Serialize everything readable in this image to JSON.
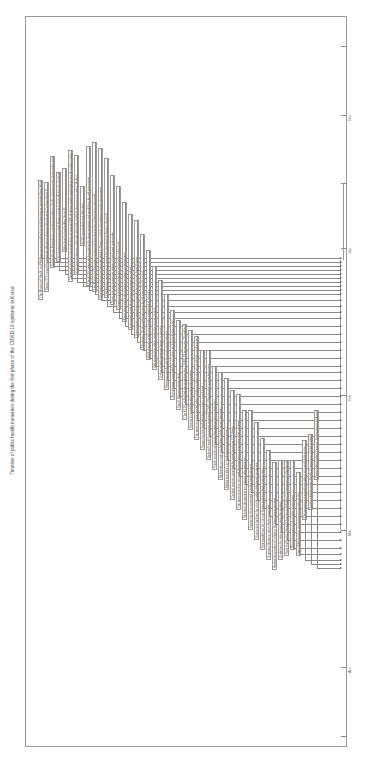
{
  "figure": {
    "title": "Timeline of public health measures during the first phase of the COVID-19 epidemic in Korea",
    "axis_color": "#9a9a9a",
    "text_color": "#444444"
  },
  "axis": {
    "ticks": [
      {
        "y": 46,
        "label": ""
      },
      {
        "y": 115,
        "label": "Dec"
      },
      {
        "y": 183,
        "label": ""
      },
      {
        "y": 248,
        "label": "Jan"
      },
      {
        "y": 395,
        "label": "Feb"
      },
      {
        "y": 530,
        "label": "Mar"
      },
      {
        "y": 667,
        "label": "Apr"
      },
      {
        "y": 736,
        "label": ""
      }
    ]
  },
  "events": [
    {
      "x": 38,
      "y": 300,
      "len": 120,
      "arrow_y": 258,
      "text": "The Ministry of Health and Welfare announced the first confirmed case (imported from Wuhan)"
    },
    {
      "x": 44,
      "y": 292,
      "len": 110,
      "arrow_y": 262,
      "text": "Korea CDC raised the national infectious disease alert level to Caution (level 2)"
    },
    {
      "x": 50,
      "y": 268,
      "len": 112,
      "arrow_y": 266,
      "text": "Special Entry Procedures including mandatory health questionnaires for travelers from Hubei"
    },
    {
      "x": 56,
      "y": 262,
      "len": 90,
      "arrow_y": 270,
      "text": "The government evacuated Korean citizens from Wuhan by chartered flights"
    },
    {
      "x": 62,
      "y": 252,
      "len": 84,
      "arrow_y": 274,
      "text": "Alert level raised to Alert (level 3)"
    },
    {
      "x": 68,
      "y": 282,
      "len": 132,
      "arrow_y": 278,
      "text": "The government announced plans to secure 50% of domestically produced masks for public supply"
    },
    {
      "x": 74,
      "y": 275,
      "len": 120,
      "arrow_y": 282,
      "text": "Entry ban on foreign nationals who had visited Hubei province within 14 days"
    },
    {
      "x": 80,
      "y": 246,
      "len": 60,
      "arrow_y": 286,
      "text": "KCDC expanded case definition"
    },
    {
      "x": 86,
      "y": 286,
      "len": 140,
      "arrow_y": 290,
      "text": "The KCDC released the criteria for close contacts and guidelines for self-quarantine"
    },
    {
      "x": 92,
      "y": 292,
      "len": 150,
      "arrow_y": 294,
      "text": "The Ministry of Education postponed the start of the school year nationwide"
    },
    {
      "x": 98,
      "y": 300,
      "len": 152,
      "arrow_y": 300,
      "text": "Shincheonji church cluster identified in Daegu; special management zones designated"
    },
    {
      "x": 104,
      "y": 298,
      "len": 140,
      "arrow_y": 306,
      "text": "The Korean government raised the alert level to Serious (level 4)"
    },
    {
      "x": 110,
      "y": 305,
      "len": 130,
      "arrow_y": 312,
      "text": "Drive-through screening stations introduced nationwide"
    },
    {
      "x": 116,
      "y": 310,
      "len": 124,
      "arrow_y": 318,
      "text": "Community treatment centers opened for mild cases"
    },
    {
      "x": 122,
      "y": 322,
      "len": 120,
      "arrow_y": 326,
      "text": "Mask rationing (5-day rotation system) implemented"
    },
    {
      "x": 128,
      "y": 330,
      "len": 116,
      "arrow_y": 334,
      "text": "Enhanced social distancing campaign launched"
    },
    {
      "x": 134,
      "y": 338,
      "len": 118,
      "arrow_y": 342,
      "text": "Special entry procedures expanded to all arrivals from Europe"
    },
    {
      "x": 140,
      "y": 350,
      "len": 116,
      "arrow_y": 350,
      "text": "Mandatory 14-day self-quarantine for all international arrivals"
    },
    {
      "x": 146,
      "y": 360,
      "len": 110,
      "arrow_y": 358,
      "text": "Walk-through screening booths introduced at airports"
    },
    {
      "x": 152,
      "y": 370,
      "len": 104,
      "arrow_y": 366,
      "text": "Self-quarantine safety protection app launched"
    },
    {
      "x": 158,
      "y": 380,
      "len": 100,
      "arrow_y": 372,
      "text": "Online school semester began in phases"
    },
    {
      "x": 164,
      "y": 390,
      "len": 96,
      "arrow_y": 380,
      "text": "Electronic wristbands for quarantine violators"
    },
    {
      "x": 170,
      "y": 400,
      "len": 90,
      "arrow_y": 388,
      "text": "Visa waivers suspended for countries restricting Korean entry"
    },
    {
      "x": 176,
      "y": 410,
      "len": 90,
      "arrow_y": 396,
      "text": "Social distancing extended"
    },
    {
      "x": 182,
      "y": 420,
      "len": 96,
      "arrow_y": 404,
      "text": "The KCDC published the guidelines for COVID-19 response (7th edition)"
    },
    {
      "x": 188,
      "y": 430,
      "len": 100,
      "arrow_y": 412,
      "text": "Testing expanded to all symptomatic travelers"
    },
    {
      "x": 194,
      "y": 440,
      "len": 104,
      "arrow_y": 420,
      "text": "The government enforced administrative orders restricting religious gatherings"
    },
    {
      "x": 200,
      "y": 450,
      "len": 100,
      "arrow_y": 428,
      "text": "Daegu hospital bed allocation system introduced"
    },
    {
      "x": 206,
      "y": 460,
      "len": 110,
      "arrow_y": 436,
      "text": "National Health Insurance covered COVID-19 testing for suspected cases"
    },
    {
      "x": 212,
      "y": 470,
      "len": 104,
      "arrow_y": 444,
      "text": "Public-private partnership for diagnostic kit production"
    },
    {
      "x": 218,
      "y": 480,
      "len": 108,
      "arrow_y": 452,
      "text": "Restriction on high-risk facilities (clubs, gyms, karaoke)"
    },
    {
      "x": 224,
      "y": 490,
      "len": 112,
      "arrow_y": 460,
      "text": "Mobile text alerts on confirmed case movement"
    },
    {
      "x": 230,
      "y": 500,
      "len": 110,
      "arrow_y": 468,
      "text": "Contact tracing supported by credit card and CCTV data"
    },
    {
      "x": 236,
      "y": 510,
      "len": 116,
      "arrow_y": 476,
      "text": "The government announced the emergency economic relief package"
    },
    {
      "x": 242,
      "y": 520,
      "len": 110,
      "arrow_y": 484,
      "text": "Hospitals designated as national safe hospitals"
    },
    {
      "x": 248,
      "y": 530,
      "len": 120,
      "arrow_y": 492,
      "text": "Screening clinics operated in public health centers"
    },
    {
      "x": 254,
      "y": 540,
      "len": 118,
      "arrow_y": 500,
      "text": "Quarantine facilities for arrivals without domestic residence"
    },
    {
      "x": 260,
      "y": 550,
      "len": 112,
      "arrow_y": 508,
      "text": "Strict guidelines for nursing homes and long-term care facilities"
    },
    {
      "x": 266,
      "y": 560,
      "len": 110,
      "arrow_y": 516,
      "text": "Overseas Koreans return flights arranged"
    },
    {
      "x": 272,
      "y": 570,
      "len": 108,
      "arrow_y": 524,
      "text": "Reduced operation of religious facilities recommended"
    },
    {
      "x": 278,
      "y": 560,
      "len": 100,
      "arrow_y": 532,
      "text": "Guidelines for distancing in daily life drafted"
    },
    {
      "x": 284,
      "y": 556,
      "len": 96,
      "arrow_y": 540,
      "text": "Daily briefing by Central Disaster and Safety Countermeasure Headquarters"
    },
    {
      "x": 290,
      "y": 550,
      "len": 90,
      "arrow_y": 548,
      "text": "Phased reopening of schools announced"
    },
    {
      "x": 296,
      "y": 556,
      "len": 84,
      "arrow_y": 554,
      "text": "Seoul Metropolitan Government operational plan"
    },
    {
      "x": 302,
      "y": 520,
      "len": 80,
      "arrow_y": 560,
      "text": "The government eased restrictions on social distancing"
    },
    {
      "x": 308,
      "y": 510,
      "len": 76,
      "arrow_y": 564,
      "text": "Incheon Metropolitan Health Commission issued guidelines"
    },
    {
      "x": 314,
      "y": 480,
      "len": 70,
      "arrow_y": 568,
      "text": "Daegu Metropolitan Council - Korean Hospital Association agreement"
    }
  ],
  "brackets": [
    {
      "x": 343,
      "top": 183,
      "bottom": 260
    },
    {
      "x": 340,
      "top": 260,
      "bottom": 395
    },
    {
      "x": 340,
      "top": 395,
      "bottom": 530
    }
  ]
}
